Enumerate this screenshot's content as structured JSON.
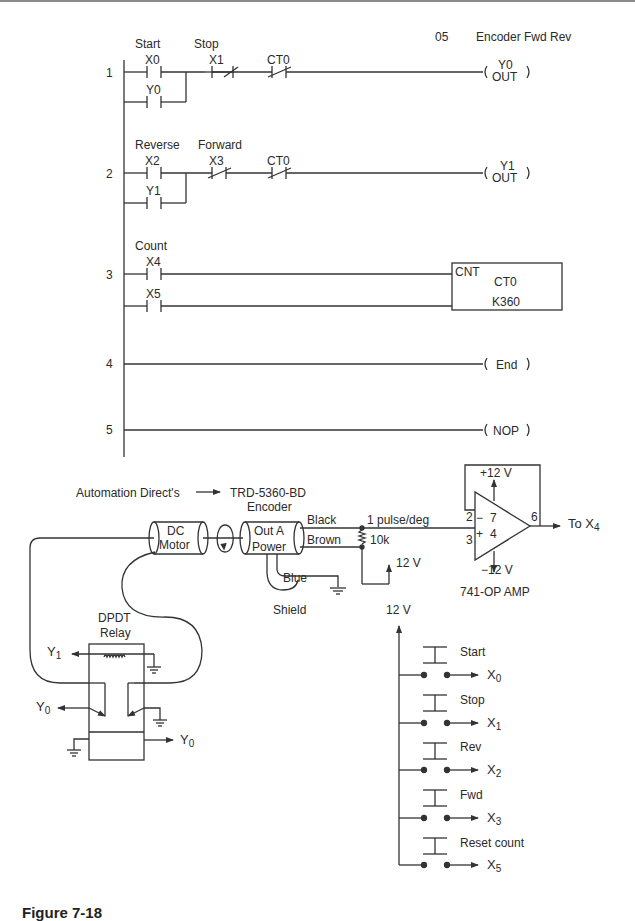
{
  "header": {
    "program_number": "05",
    "program_title": "Encoder Fwd Rev"
  },
  "ladder": {
    "rungs": [
      {
        "number": "1",
        "contacts": [
          {
            "label": "Start",
            "address": "X0",
            "type": "NO"
          },
          {
            "label": "",
            "address": "Y0",
            "type": "NO",
            "parallel": true
          },
          {
            "label": "Stop",
            "address": "X1",
            "type": "NC"
          },
          {
            "label": "",
            "address": "CT0",
            "type": "NC"
          }
        ],
        "output": {
          "address": "Y0",
          "instruction": "OUT"
        }
      },
      {
        "number": "2",
        "contacts": [
          {
            "label": "Reverse",
            "address": "X2",
            "type": "NO"
          },
          {
            "label": "",
            "address": "Y1",
            "type": "NO",
            "parallel": true
          },
          {
            "label": "Forward",
            "address": "X3",
            "type": "NC"
          },
          {
            "label": "",
            "address": "CT0",
            "type": "NC"
          }
        ],
        "output": {
          "address": "Y1",
          "instruction": "OUT"
        }
      },
      {
        "number": "3",
        "contacts": [
          {
            "label": "Count",
            "address": "X4",
            "type": "NO"
          },
          {
            "label": "",
            "address": "X5",
            "type": "NO"
          }
        ],
        "counter": {
          "type": "CNT",
          "name": "CT0",
          "preset": "K360"
        }
      },
      {
        "number": "4",
        "output": {
          "instruction": "End"
        }
      },
      {
        "number": "5",
        "output": {
          "instruction": "NOP"
        }
      }
    ]
  },
  "wiring": {
    "vendor_label": "Automation Direct's",
    "encoder_model": "TRD-5360-BD",
    "encoder_label": "Encoder",
    "encoder_terminals": [
      "Out A",
      "Power"
    ],
    "motor_label_line1": "DC",
    "motor_label_line2": "Motor",
    "wires": {
      "black": "Black",
      "brown": "Brown",
      "blue": "Blue",
      "shield": "Shield"
    },
    "signal_label": "1 pulse/deg",
    "resistor": "10k",
    "pullup_supply": "12 V",
    "opamp": {
      "pos_supply": "+12 V",
      "neg_supply": "−12 V",
      "pins": {
        "inv": "2",
        "noninv": "3",
        "out": "6",
        "vplus": "7",
        "vminus": "4"
      },
      "inv_sign": "−",
      "noninv_sign": "+",
      "output_label": "To X",
      "output_sub": "4",
      "name": "741-OP AMP"
    },
    "relay": {
      "title_line1": "DPDT",
      "title_line2": "Relay",
      "coil_input": "Y",
      "coil_input_sub": "1",
      "left_output": "Y",
      "left_output_sub": "0",
      "right_output": "Y",
      "right_output_sub": "0"
    },
    "switch_supply": "12 V",
    "switches": [
      {
        "label": "Start",
        "output": "X",
        "sub": "0"
      },
      {
        "label": "Stop",
        "output": "X",
        "sub": "1"
      },
      {
        "label": "Rev",
        "output": "X",
        "sub": "2"
      },
      {
        "label": "Fwd",
        "output": "X",
        "sub": "3"
      },
      {
        "label": "Reset count",
        "output": "X",
        "sub": "5"
      }
    ]
  },
  "caption": "Figure 7-18"
}
